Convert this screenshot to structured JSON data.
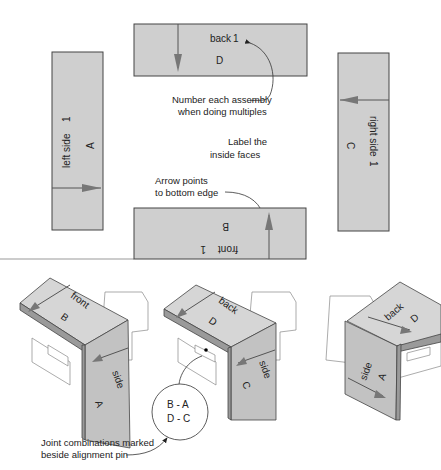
{
  "panels": {
    "back": {
      "name": "back",
      "number": "1",
      "letter": "D"
    },
    "left": {
      "name": "left side",
      "number": "1",
      "letter": "A"
    },
    "right": {
      "name": "right side",
      "number": "1",
      "letter": "C"
    },
    "front": {
      "name": "front",
      "number": "1",
      "letter": "B"
    }
  },
  "notes": {
    "number_line1": "Number each assembly",
    "number_line2": "when doing multiples",
    "label_line1": "Label the",
    "label_line2": "inside faces",
    "arrow_line1": "Arrow points",
    "arrow_line2": "to bottom edge",
    "joint_line1": "Joint combinations marked",
    "joint_line2": "beside alignment pin"
  },
  "assemblies": [
    {
      "top_label": "front",
      "top_letter": "B",
      "side_label": "side",
      "side_letter": "A"
    },
    {
      "top_label": "back",
      "top_letter": "D",
      "side_label": "side",
      "side_letter": "C"
    },
    {
      "top_label": "back",
      "top_letter": "D",
      "side_label": "side",
      "side_letter": "A"
    }
  ],
  "circle": {
    "line1": "B - A",
    "line2": "D - C"
  },
  "colors": {
    "panel": "#cfcfcf",
    "outline": "#444444",
    "arrow": "#777777"
  }
}
